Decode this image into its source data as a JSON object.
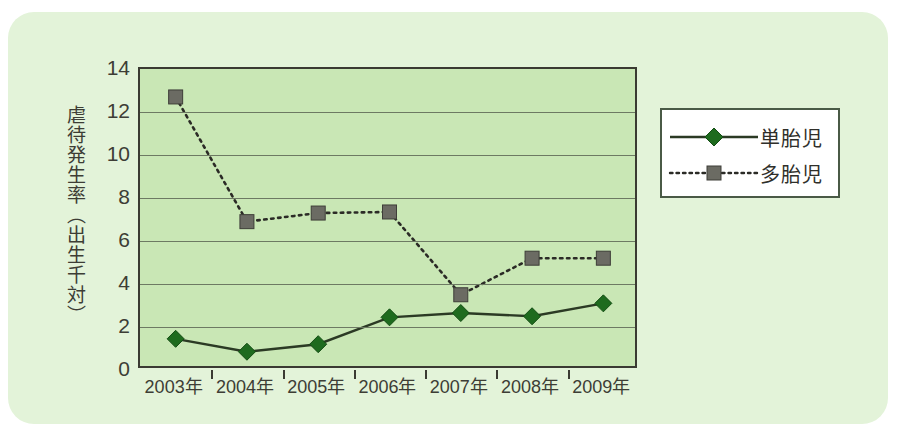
{
  "chart_data": {
    "type": "line",
    "title": "",
    "xlabel": "",
    "ylabel": "虐待発生率（出生千対）",
    "categories": [
      "2003年",
      "2004年",
      "2005年",
      "2006年",
      "2007年",
      "2008年",
      "2009年"
    ],
    "yticks": [
      0,
      2,
      4,
      6,
      8,
      10,
      12,
      14
    ],
    "ylim": [
      0,
      14
    ],
    "grid": true,
    "legend_position": "right",
    "series": [
      {
        "name": "単胎児",
        "values": [
          1.45,
          0.85,
          1.2,
          2.45,
          2.65,
          2.5,
          3.1
        ],
        "color": "#1e6b1e",
        "line_color": "#2b3a24",
        "line_style": "solid",
        "marker": "diamond"
      },
      {
        "name": "多胎児",
        "values": [
          12.7,
          6.9,
          7.3,
          7.35,
          3.5,
          5.2,
          5.2
        ],
        "color": "#6b6b63",
        "line_color": "#2b2b26",
        "line_style": "dotted",
        "marker": "square"
      }
    ]
  },
  "colors": {
    "panel_background": "#e3f3d9",
    "plot_background": "#c9e7b5",
    "axis": "#3a3a32",
    "gridline": "#6d7a63",
    "text": "#3d3d35",
    "legend_background": "#ffffff",
    "legend_border": "#4a5a46"
  }
}
